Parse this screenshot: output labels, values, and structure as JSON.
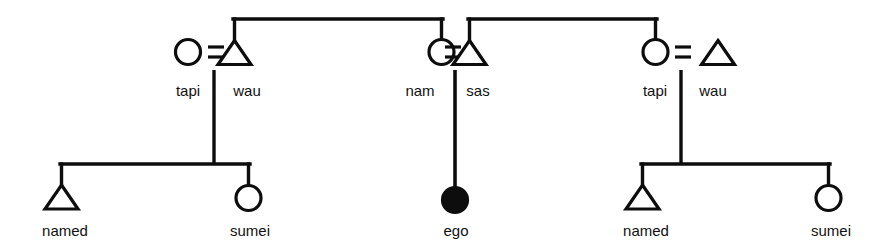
{
  "diagram": {
    "type": "kinship-chart",
    "title": "",
    "stroke_color": "#0d0d0d",
    "fill_filled": "#0d0d0d",
    "fill_open": "#ffffff",
    "background": "#ffffff",
    "symbols": {
      "male": "triangle",
      "female": "circle",
      "ego": "filled-circle",
      "marriage": "equals-sign",
      "descent": "vertical-line",
      "sibling": "horizontal-bar"
    },
    "generations": [
      {
        "name": "parental-generation",
        "couples": [
          {
            "id": "couple-left",
            "female": {
              "label": "tapi",
              "symbol": "circle"
            },
            "male": {
              "label": "wau",
              "symbol": "triangle"
            },
            "marriage_symbol": "="
          },
          {
            "id": "couple-middle",
            "female": {
              "label": "nam",
              "symbol": "circle"
            },
            "male": {
              "label": "sas",
              "symbol": "triangle"
            },
            "marriage_symbol": "="
          },
          {
            "id": "couple-right",
            "female": {
              "label": "tapi",
              "symbol": "circle"
            },
            "male": {
              "label": "wau",
              "symbol": "triangle"
            },
            "marriage_symbol": "="
          }
        ]
      },
      {
        "name": "ego-generation",
        "children": [
          {
            "id": "child-left-male",
            "label": "named",
            "symbol": "triangle",
            "parent_couple": "couple-left"
          },
          {
            "id": "child-left-female",
            "label": "sumei",
            "symbol": "circle",
            "parent_couple": "couple-left"
          },
          {
            "id": "ego",
            "label": "ego",
            "symbol": "filled-circle",
            "parent_couple": "couple-middle"
          },
          {
            "id": "child-right-male",
            "label": "named",
            "symbol": "triangle",
            "parent_couple": "couple-right"
          },
          {
            "id": "child-right-female",
            "label": "sumei",
            "symbol": "circle",
            "parent_couple": "couple-right"
          }
        ]
      }
    ],
    "sibling_links": [
      {
        "id": "sibling-link-top-left",
        "from": "couple-left.male",
        "to": "couple-middle.female"
      },
      {
        "id": "sibling-link-top-right",
        "from": "couple-middle.male",
        "to": "couple-right.female"
      }
    ],
    "labels": {
      "tapi_left": "tapi",
      "wau_left": "wau",
      "nam": "nam",
      "sas": "sas",
      "tapi_right": "tapi",
      "wau_right": "wau",
      "named_left": "named",
      "sumei_left": "sumei",
      "ego": "ego",
      "named_right": "named",
      "sumei_right": "sumei"
    }
  }
}
